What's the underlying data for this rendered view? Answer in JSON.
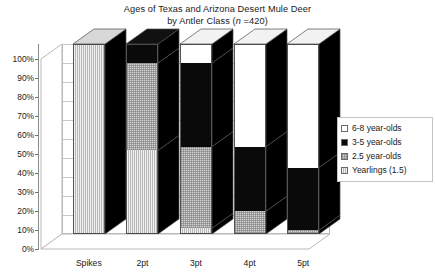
{
  "chart_data": {
    "type": "bar",
    "subtype": "stacked-percent-3d",
    "title": "Ages of Texas and Arizona Desert Mule Deer",
    "subtitle": "by Antler Class (n =420)",
    "subtitle_parts": {
      "prefix": "by Antler Class (",
      "italic": "n",
      "suffix": " =420)"
    },
    "xlabel": "",
    "ylabel": "",
    "ylim": [
      0,
      100
    ],
    "yticks": [
      "0%",
      "10%",
      "20%",
      "30%",
      "40%",
      "50%",
      "60%",
      "70%",
      "80%",
      "90%",
      "100%"
    ],
    "ytick_values": [
      0,
      10,
      20,
      30,
      40,
      50,
      60,
      70,
      80,
      90,
      100
    ],
    "grid": true,
    "legend_position": "right",
    "categories": [
      "Spikes",
      "2pt",
      "3pt",
      "4pt",
      "5pt"
    ],
    "series": [
      {
        "name": "Yearlings (1.5)",
        "key": "yearlings",
        "color": "#c8c8c8",
        "pattern": "vertical-lines",
        "values": [
          100,
          44,
          3,
          0,
          0
        ]
      },
      {
        "name": "2.5 year-olds",
        "key": "y25",
        "color": "#d2d2d2",
        "pattern": "checker",
        "values": [
          0,
          46,
          43,
          12,
          2
        ]
      },
      {
        "name": "3-5 year-olds",
        "key": "y35",
        "color": "#0a0a0a",
        "pattern": "solid",
        "values": [
          0,
          10,
          44,
          34,
          33
        ]
      },
      {
        "name": "6-8 year-olds",
        "key": "y68",
        "color": "#ffffff",
        "pattern": "empty",
        "values": [
          0,
          0,
          10,
          54,
          65
        ]
      }
    ]
  },
  "legend": {
    "items": [
      {
        "label": "6-8 year-olds",
        "swatch": "empty"
      },
      {
        "label": "3-5 year-olds",
        "swatch": "solid-black"
      },
      {
        "label": "2.5 year-olds",
        "swatch": "checker"
      },
      {
        "label": "Yearlings (1.5)",
        "swatch": "vertical-lines"
      }
    ]
  }
}
